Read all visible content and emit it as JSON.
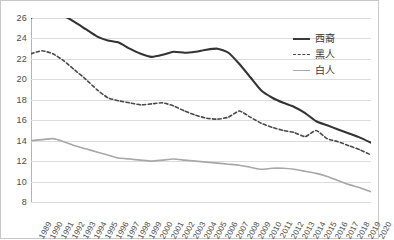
{
  "chart_data": {
    "type": "line",
    "title": "",
    "xlabel": "",
    "ylabel": "",
    "ylim": [
      8,
      26
    ],
    "ytick_step": 2,
    "yticks": [
      26,
      24,
      22,
      20,
      18,
      16,
      14,
      12,
      10,
      8
    ],
    "grid": true,
    "legend_position": "top-right",
    "x": [
      1989,
      1990,
      1991,
      1992,
      1993,
      1994,
      1995,
      1996,
      1997,
      1998,
      1999,
      2000,
      2001,
      2002,
      2003,
      2004,
      2005,
      2006,
      2007,
      2008,
      2009,
      2010,
      2011,
      2012,
      2013,
      2014,
      2015,
      2016,
      2017,
      2018,
      2019,
      2020
    ],
    "categories": [
      "1989",
      "1990",
      "1991",
      "1992",
      "1993",
      "1994",
      "1995",
      "1996",
      "1997",
      "1998",
      "1999",
      "2000",
      "2001",
      "2002",
      "2003",
      "2004",
      "2005",
      "2006",
      "2007",
      "2008",
      "2009",
      "2010",
      "2011",
      "2012",
      "2013",
      "2014",
      "2015",
      "2016",
      "2017",
      "2018",
      "2019",
      "2020"
    ],
    "series": [
      {
        "name": "西裔",
        "style": "solid",
        "color": "#333333",
        "width": 2.1,
        "values": [
          26.0,
          26.6,
          26.5,
          26.2,
          25.6,
          24.9,
          24.2,
          23.8,
          23.6,
          23.0,
          22.5,
          22.2,
          22.4,
          22.7,
          22.6,
          22.7,
          22.9,
          23.0,
          22.6,
          21.5,
          20.2,
          18.9,
          18.2,
          17.7,
          17.3,
          16.7,
          15.9,
          15.5,
          15.1,
          14.7,
          14.3,
          13.8
        ]
      },
      {
        "name": "黑人",
        "style": "dashed",
        "color": "#4a4a4a",
        "width": 1.6,
        "values": [
          22.5,
          22.8,
          22.5,
          21.8,
          20.9,
          20.0,
          19.0,
          18.2,
          17.9,
          17.7,
          17.5,
          17.6,
          17.7,
          17.4,
          16.9,
          16.5,
          16.2,
          16.1,
          16.3,
          16.9,
          16.3,
          15.7,
          15.3,
          15.0,
          14.8,
          14.4,
          15.0,
          14.2,
          13.9,
          13.5,
          13.1,
          12.6
        ]
      },
      {
        "name": "白人",
        "style": "solid",
        "color": "#a8a8a8",
        "width": 1.6,
        "values": [
          14.0,
          14.1,
          14.2,
          13.9,
          13.5,
          13.2,
          12.9,
          12.6,
          12.3,
          12.2,
          12.1,
          12.0,
          12.1,
          12.2,
          12.1,
          12.0,
          11.9,
          11.8,
          11.7,
          11.6,
          11.4,
          11.2,
          11.3,
          11.3,
          11.2,
          11.0,
          10.8,
          10.5,
          10.1,
          9.7,
          9.4,
          9.0
        ]
      }
    ]
  }
}
